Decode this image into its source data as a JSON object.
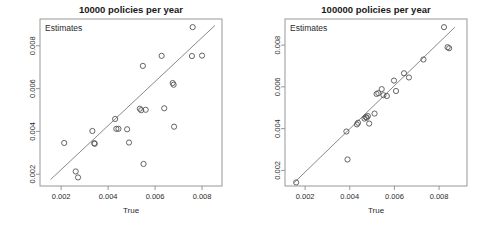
{
  "figure": {
    "background_color": "#ffffff",
    "point_color": "#555555",
    "line_color": "#7a7a7a",
    "frame_color": "#8d8d8d",
    "panel_count": 2
  },
  "chart_data": [
    {
      "type": "scatter",
      "panel_index": 0,
      "title": "10000 policies per year",
      "xlabel": "True",
      "ylabel": "Estimates",
      "ylabel_placement": "inside-top-left",
      "grid": false,
      "legend": "none",
      "xlim": [
        0.0011,
        0.00885
      ],
      "ylim": [
        0.00145,
        0.00925
      ],
      "xticks": [
        0.002,
        0.004,
        0.006,
        0.008
      ],
      "xticklabels": [
        "0.002",
        "0.004",
        "0.006",
        "0.008"
      ],
      "yticks": [
        0.002,
        0.004,
        0.006,
        0.008
      ],
      "yticklabels": [
        "0.002",
        "0.004",
        "0.006",
        "0.008"
      ],
      "reference_line": {
        "type": "identity-fit",
        "x": [
          0.00155,
          0.00855
        ],
        "y": [
          0.00175,
          0.00895
        ]
      },
      "x": [
        0.00213,
        0.00262,
        0.00272,
        0.00333,
        0.00341,
        0.00343,
        0.0043,
        0.00435,
        0.00444,
        0.00481,
        0.00489,
        0.00535,
        0.00541,
        0.00548,
        0.00551,
        0.0056,
        0.00628,
        0.00639,
        0.00675,
        0.00679,
        0.00681,
        0.00757,
        0.0076,
        0.008
      ],
      "y": [
        0.00346,
        0.00213,
        0.00185,
        0.00402,
        0.00345,
        0.00342,
        0.00458,
        0.00412,
        0.00412,
        0.0041,
        0.00348,
        0.00506,
        0.00499,
        0.00706,
        0.00248,
        0.00501,
        0.00753,
        0.00508,
        0.00626,
        0.00618,
        0.00422,
        0.00752,
        0.00887,
        0.00754
      ]
    },
    {
      "type": "scatter",
      "panel_index": 1,
      "title": "100000 policies per year",
      "xlabel": "True",
      "ylabel": "Estimates",
      "ylabel_placement": "inside-top-left",
      "grid": false,
      "legend": "none",
      "xlim": [
        0.0011,
        0.00925
      ],
      "ylim": [
        0.00125,
        0.00925
      ],
      "xticks": [
        0.002,
        0.004,
        0.006,
        0.008
      ],
      "xticklabels": [
        "0.002",
        "0.004",
        "0.006",
        "0.008"
      ],
      "yticks": [
        0.002,
        0.004,
        0.006,
        0.008
      ],
      "yticklabels": [
        "0.002",
        "0.004",
        "0.006",
        "0.008"
      ],
      "reference_line": {
        "type": "identity-fit",
        "x": [
          0.0015,
          0.0087
        ],
        "y": [
          0.0014,
          0.00885
        ]
      },
      "x": [
        0.0016,
        0.00385,
        0.0039,
        0.00432,
        0.00437,
        0.00466,
        0.00472,
        0.00476,
        0.00481,
        0.00487,
        0.00511,
        0.0052,
        0.00528,
        0.00543,
        0.00551,
        0.00566,
        0.00598,
        0.00607,
        0.00643,
        0.00665,
        0.0073,
        0.00822,
        0.00838,
        0.00845
      ],
      "y": [
        0.00142,
        0.00386,
        0.00252,
        0.0042,
        0.00428,
        0.00448,
        0.00455,
        0.00452,
        0.0046,
        0.00424,
        0.00472,
        0.00566,
        0.0057,
        0.00589,
        0.0056,
        0.00556,
        0.0063,
        0.0058,
        0.00665,
        0.00645,
        0.00731,
        0.00886,
        0.0079,
        0.00785
      ]
    }
  ]
}
